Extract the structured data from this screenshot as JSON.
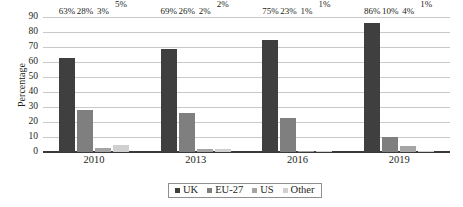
{
  "chart_data": {
    "type": "bar",
    "title": "",
    "subtitle": "",
    "xlabel": "",
    "ylabel": "Percentage",
    "categories": [
      "2010",
      "2013",
      "2016",
      "2019"
    ],
    "series": [
      {
        "name": "UK",
        "values": [
          63,
          69,
          75,
          86
        ],
        "color": "#3f3f3f"
      },
      {
        "name": "EU-27",
        "values": [
          28,
          26,
          23,
          10
        ],
        "color": "#7f7f7f"
      },
      {
        "name": "US",
        "values": [
          3,
          2,
          1,
          4
        ],
        "color": "#a5a5a5"
      },
      {
        "name": "Other",
        "values": [
          5,
          2,
          1,
          1
        ],
        "color": "#d0d0d0"
      }
    ],
    "data_labels": [
      [
        "63%",
        "28%",
        "3%",
        "5%"
      ],
      [
        "69%",
        "26%",
        "2%",
        "2%"
      ],
      [
        "75%",
        "23%",
        "1%",
        "1%"
      ],
      [
        "86%",
        "10%",
        "4%",
        "1%"
      ]
    ],
    "ylim": [
      0,
      90
    ],
    "ytick_step": 10,
    "yticks": [
      "90",
      "80",
      "70",
      "60",
      "50",
      "40",
      "30",
      "20",
      "10",
      "0"
    ],
    "grid": "horizontal",
    "legend_position": "bottom",
    "legend": [
      "UK",
      "EU-27",
      "US",
      "Other"
    ]
  }
}
